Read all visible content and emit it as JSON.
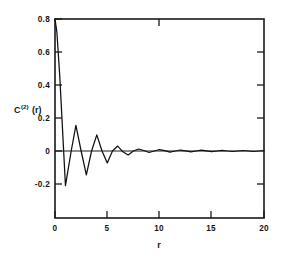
{
  "chart_data": {
    "type": "line",
    "title": "",
    "subtitle": "",
    "xlabel": "r",
    "ylabel": "C(2)(r)",
    "ylabel_base": "C",
    "ylabel_superscript": "(2)",
    "ylabel_arg": "(r)",
    "xlim": [
      0,
      20
    ],
    "ylim": [
      -0.28,
      0.8
    ],
    "xticks": [
      0,
      5,
      10,
      15,
      20
    ],
    "xticklabels": [
      "0",
      "5",
      "10",
      "15",
      "20"
    ],
    "yticks": [
      -0.2,
      0,
      0.2,
      0.4,
      0.6,
      0.8
    ],
    "yticklabels": [
      "-0.2",
      "0",
      "0.2",
      "0.4",
      "0.6",
      "0.8"
    ],
    "grid": false,
    "legend": false,
    "legend_position": "none",
    "line_color": "#111111",
    "frame_color": "#1a1a1a",
    "background_color": "#ffffff",
    "zero_reference_line": true,
    "series": [
      {
        "name": "C(2)(r)",
        "x": [
          0.0,
          0.18,
          0.45,
          1.0,
          1.55,
          2.0,
          2.5,
          3.0,
          3.5,
          4.0,
          4.5,
          5.0,
          5.5,
          6.0,
          6.5,
          7.0,
          7.5,
          8.0,
          8.5,
          9.0,
          9.5,
          10.0,
          10.5,
          11.0,
          11.5,
          12.0,
          12.5,
          13.0,
          13.5,
          14.0,
          14.5,
          15.0,
          15.5,
          16.0,
          16.5,
          17.0,
          17.5,
          18.0,
          18.5,
          19.0,
          19.5,
          20.0
        ],
        "y": [
          0.84,
          0.72,
          0.46,
          -0.21,
          0.0,
          0.155,
          0.0,
          -0.145,
          0.0,
          0.098,
          0.0,
          -0.072,
          0.0,
          0.03,
          -0.005,
          -0.024,
          0.0,
          0.012,
          0.003,
          -0.009,
          0.0,
          0.009,
          0.002,
          -0.007,
          0.0,
          0.006,
          0.001,
          -0.005,
          0.0,
          0.005,
          0.001,
          -0.004,
          0.0,
          0.004,
          0.0,
          -0.003,
          0.0,
          0.003,
          0.0,
          -0.003,
          0.0,
          0.002
        ],
        "description": "Damped oscillatory pair correlation function decaying to zero"
      }
    ],
    "annotations": []
  },
  "axis_titles": {
    "x": "r",
    "y_base": "C",
    "y_sup": "(2)",
    "y_arg": "(r)"
  }
}
